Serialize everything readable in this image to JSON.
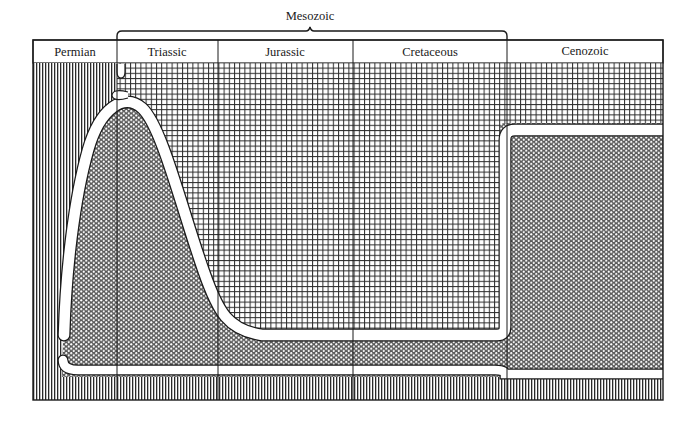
{
  "diagram": {
    "type": "geologic-timeline-diversity",
    "bracket": {
      "label": "Mesozoic",
      "spans": [
        "Triassic",
        "Jurassic",
        "Cretaceous"
      ]
    },
    "periods": [
      {
        "label": "Permian",
        "x0": 33,
        "x1": 117
      },
      {
        "label": "Triassic",
        "x0": 117,
        "x1": 218
      },
      {
        "label": "Jurassic",
        "x0": 218,
        "x1": 353
      },
      {
        "label": "Cretaceous",
        "x0": 353,
        "x1": 507
      },
      {
        "label": "Cenozoic",
        "x0": 507,
        "x1": 663
      }
    ],
    "patterns": {
      "top_region": "grid-hatch",
      "middle_region": "dot-stipple",
      "bottom_region": "vertical-hatch"
    },
    "colors": {
      "ink": "#1a1a1a",
      "paper": "#ffffff"
    }
  }
}
